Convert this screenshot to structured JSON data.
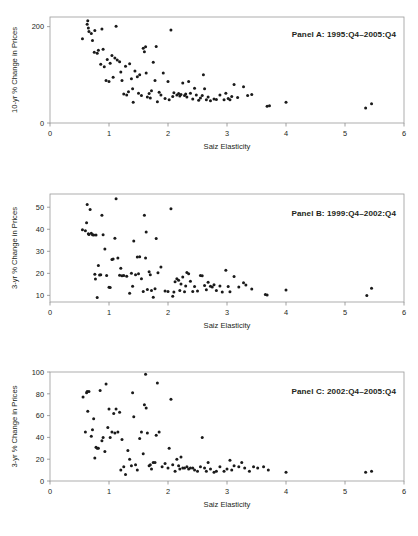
{
  "figure": {
    "background": "#ffffff",
    "point_color": "#1a1a1a",
    "axis_color": "#8c8c8c"
  },
  "chart_data": [
    {
      "type": "scatter",
      "panel_id": "A",
      "title": "Panel A:  1995:Q4–2005:Q4",
      "xlabel": "Saiz Elasticity",
      "ylabel": "10-yr % Change in Prices",
      "xlim": [
        0,
        6
      ],
      "ylim": [
        0,
        220
      ],
      "xticks": [
        0,
        1,
        2,
        3,
        4,
        5,
        6
      ],
      "yticks": [
        0,
        200
      ],
      "grid": false,
      "legend": "none",
      "points": [
        [
          0.55,
          175
        ],
        [
          0.63,
          205
        ],
        [
          0.64,
          212
        ],
        [
          0.65,
          197
        ],
        [
          0.66,
          190
        ],
        [
          0.7,
          186
        ],
        [
          0.72,
          171
        ],
        [
          0.75,
          147
        ],
        [
          0.76,
          192
        ],
        [
          0.8,
          145
        ],
        [
          0.82,
          151
        ],
        [
          0.86,
          122
        ],
        [
          0.88,
          195
        ],
        [
          0.9,
          153
        ],
        [
          0.92,
          117
        ],
        [
          0.95,
          88
        ],
        [
          0.97,
          132
        ],
        [
          1.0,
          86
        ],
        [
          1.02,
          124
        ],
        [
          1.05,
          140
        ],
        [
          1.07,
          95
        ],
        [
          1.1,
          135
        ],
        [
          1.12,
          201
        ],
        [
          1.14,
          131
        ],
        [
          1.18,
          127
        ],
        [
          1.2,
          106
        ],
        [
          1.22,
          88
        ],
        [
          1.25,
          60
        ],
        [
          1.28,
          118
        ],
        [
          1.3,
          58
        ],
        [
          1.33,
          65
        ],
        [
          1.35,
          123
        ],
        [
          1.38,
          92
        ],
        [
          1.4,
          71
        ],
        [
          1.41,
          43
        ],
        [
          1.44,
          108
        ],
        [
          1.48,
          96
        ],
        [
          1.5,
          62
        ],
        [
          1.52,
          100
        ],
        [
          1.55,
          57
        ],
        [
          1.58,
          155
        ],
        [
          1.6,
          148
        ],
        [
          1.62,
          158
        ],
        [
          1.63,
          104
        ],
        [
          1.65,
          54
        ],
        [
          1.68,
          61
        ],
        [
          1.7,
          52
        ],
        [
          1.72,
          67
        ],
        [
          1.75,
          126
        ],
        [
          1.78,
          88
        ],
        [
          1.8,
          159
        ],
        [
          1.82,
          44
        ],
        [
          1.85,
          64
        ],
        [
          1.88,
          58
        ],
        [
          1.92,
          104
        ],
        [
          1.95,
          51
        ],
        [
          2.0,
          86
        ],
        [
          2.02,
          48
        ],
        [
          2.05,
          193
        ],
        [
          2.08,
          55
        ],
        [
          2.1,
          63
        ],
        [
          2.15,
          58
        ],
        [
          2.18,
          61
        ],
        [
          2.2,
          56
        ],
        [
          2.22,
          59
        ],
        [
          2.25,
          83
        ],
        [
          2.28,
          57
        ],
        [
          2.3,
          60
        ],
        [
          2.32,
          54
        ],
        [
          2.35,
          86
        ],
        [
          2.38,
          62
        ],
        [
          2.42,
          50
        ],
        [
          2.45,
          72
        ],
        [
          2.48,
          58
        ],
        [
          2.52,
          47
        ],
        [
          2.55,
          52
        ],
        [
          2.58,
          57
        ],
        [
          2.6,
          100
        ],
        [
          2.62,
          71
        ],
        [
          2.65,
          48
        ],
        [
          2.68,
          54
        ],
        [
          2.72,
          46
        ],
        [
          2.78,
          50
        ],
        [
          2.82,
          49
        ],
        [
          2.88,
          58
        ],
        [
          2.95,
          48
        ],
        [
          2.98,
          62
        ],
        [
          3.02,
          51
        ],
        [
          3.05,
          48
        ],
        [
          3.08,
          55
        ],
        [
          3.12,
          80
        ],
        [
          3.18,
          53
        ],
        [
          3.28,
          75
        ],
        [
          3.35,
          57
        ],
        [
          3.42,
          59
        ],
        [
          3.68,
          35
        ],
        [
          3.72,
          36
        ],
        [
          4.0,
          43
        ],
        [
          5.35,
          31
        ],
        [
          5.45,
          40
        ]
      ]
    },
    {
      "type": "scatter",
      "panel_id": "B",
      "title": "Panel B:  1999:Q4–2002:Q4",
      "xlabel": "Saiz Elasticity",
      "ylabel": "3-yr % Change in Prices",
      "xlim": [
        0,
        6
      ],
      "ylim": [
        7,
        56
      ],
      "xticks": [
        0,
        1,
        2,
        3,
        4,
        5,
        6
      ],
      "yticks": [
        10,
        20,
        30,
        40,
        50
      ],
      "grid": false,
      "legend": "none",
      "points": [
        [
          0.55,
          39.8
        ],
        [
          0.6,
          39.3
        ],
        [
          0.62,
          43.0
        ],
        [
          0.63,
          51.2
        ],
        [
          0.65,
          38.0
        ],
        [
          0.66,
          37.6
        ],
        [
          0.68,
          49.0
        ],
        [
          0.7,
          38.2
        ],
        [
          0.72,
          37.5
        ],
        [
          0.74,
          37.4
        ],
        [
          0.76,
          19.6
        ],
        [
          0.77,
          17.4
        ],
        [
          0.78,
          37.4
        ],
        [
          0.8,
          9.0
        ],
        [
          0.82,
          23.6
        ],
        [
          0.84,
          19.2
        ],
        [
          0.86,
          19.4
        ],
        [
          0.88,
          46.4
        ],
        [
          0.9,
          37.5
        ],
        [
          0.93,
          31.0
        ],
        [
          0.96,
          19.0
        ],
        [
          1.0,
          13.7
        ],
        [
          1.02,
          13.6
        ],
        [
          1.05,
          26.3
        ],
        [
          1.07,
          26.5
        ],
        [
          1.1,
          35.9
        ],
        [
          1.12,
          53.8
        ],
        [
          1.15,
          27.0
        ],
        [
          1.18,
          19.1
        ],
        [
          1.2,
          22.3
        ],
        [
          1.22,
          18.9
        ],
        [
          1.25,
          19.0
        ],
        [
          1.3,
          18.7
        ],
        [
          1.35,
          11.0
        ],
        [
          1.38,
          20.0
        ],
        [
          1.4,
          14.1
        ],
        [
          1.42,
          34.7
        ],
        [
          1.45,
          19.4
        ],
        [
          1.48,
          27.4
        ],
        [
          1.5,
          19.8
        ],
        [
          1.52,
          27.5
        ],
        [
          1.55,
          17.5
        ],
        [
          1.58,
          11.8
        ],
        [
          1.6,
          46.4
        ],
        [
          1.62,
          27.0
        ],
        [
          1.63,
          38.8
        ],
        [
          1.65,
          12.7
        ],
        [
          1.68,
          20.7
        ],
        [
          1.7,
          19.4
        ],
        [
          1.72,
          12.2
        ],
        [
          1.75,
          9.2
        ],
        [
          1.78,
          13.0
        ],
        [
          1.8,
          35.8
        ],
        [
          1.83,
          20.3
        ],
        [
          1.88,
          22.9
        ],
        [
          1.95,
          12.0
        ],
        [
          2.0,
          11.8
        ],
        [
          2.05,
          49.3
        ],
        [
          2.08,
          9.6
        ],
        [
          2.1,
          11.5
        ],
        [
          2.12,
          16.2
        ],
        [
          2.15,
          17.5
        ],
        [
          2.18,
          16.9
        ],
        [
          2.2,
          12.2
        ],
        [
          2.22,
          15.2
        ],
        [
          2.25,
          18.3
        ],
        [
          2.28,
          11.7
        ],
        [
          2.3,
          14.3
        ],
        [
          2.32,
          20.4
        ],
        [
          2.35,
          19.8
        ],
        [
          2.38,
          16.4
        ],
        [
          2.42,
          11.8
        ],
        [
          2.45,
          14.0
        ],
        [
          2.5,
          12.0
        ],
        [
          2.55,
          19.0
        ],
        [
          2.58,
          18.9
        ],
        [
          2.62,
          14.5
        ],
        [
          2.65,
          12.6
        ],
        [
          2.68,
          16.0
        ],
        [
          2.72,
          14.1
        ],
        [
          2.75,
          13.8
        ],
        [
          2.78,
          14.8
        ],
        [
          2.82,
          12.2
        ],
        [
          2.88,
          14.3
        ],
        [
          2.92,
          11.5
        ],
        [
          2.98,
          21.4
        ],
        [
          3.02,
          14.0
        ],
        [
          3.05,
          11.6
        ],
        [
          3.12,
          18.6
        ],
        [
          3.2,
          13.8
        ],
        [
          3.28,
          15.7
        ],
        [
          3.32,
          14.7
        ],
        [
          3.42,
          12.9
        ],
        [
          3.65,
          10.4
        ],
        [
          3.68,
          10.2
        ],
        [
          4.0,
          12.4
        ],
        [
          5.37,
          10.0
        ],
        [
          5.45,
          13.2
        ]
      ]
    },
    {
      "type": "scatter",
      "panel_id": "C",
      "title": "Panel C:  2002:Q4–2005:Q4",
      "xlabel": "Saiz Elasticity",
      "ylabel": "3-yr % Change in Prices",
      "xlim": [
        0,
        6
      ],
      "ylim": [
        0,
        100
      ],
      "xticks": [
        0,
        1,
        2,
        3,
        4,
        5,
        6
      ],
      "yticks": [
        0,
        20,
        40,
        60,
        80,
        100
      ],
      "grid": false,
      "legend": "none",
      "points": [
        [
          0.56,
          77
        ],
        [
          0.6,
          45
        ],
        [
          0.62,
          81
        ],
        [
          0.63,
          82
        ],
        [
          0.64,
          64
        ],
        [
          0.66,
          82
        ],
        [
          0.7,
          41
        ],
        [
          0.72,
          47
        ],
        [
          0.74,
          57
        ],
        [
          0.76,
          21
        ],
        [
          0.78,
          31
        ],
        [
          0.8,
          30
        ],
        [
          0.82,
          30
        ],
        [
          0.85,
          83
        ],
        [
          0.88,
          37
        ],
        [
          0.9,
          40
        ],
        [
          0.93,
          27
        ],
        [
          0.95,
          89
        ],
        [
          0.98,
          49
        ],
        [
          1.0,
          66
        ],
        [
          1.02,
          40
        ],
        [
          1.05,
          45
        ],
        [
          1.08,
          62
        ],
        [
          1.1,
          44
        ],
        [
          1.12,
          66
        ],
        [
          1.15,
          45
        ],
        [
          1.18,
          63
        ],
        [
          1.2,
          10
        ],
        [
          1.22,
          38
        ],
        [
          1.25,
          13
        ],
        [
          1.28,
          6
        ],
        [
          1.32,
          28
        ],
        [
          1.35,
          20
        ],
        [
          1.38,
          14
        ],
        [
          1.4,
          81
        ],
        [
          1.42,
          59
        ],
        [
          1.45,
          15
        ],
        [
          1.48,
          10
        ],
        [
          1.52,
          39
        ],
        [
          1.55,
          45
        ],
        [
          1.58,
          25
        ],
        [
          1.6,
          70
        ],
        [
          1.62,
          98
        ],
        [
          1.63,
          67
        ],
        [
          1.65,
          44
        ],
        [
          1.68,
          14
        ],
        [
          1.7,
          15
        ],
        [
          1.72,
          11
        ],
        [
          1.75,
          17
        ],
        [
          1.78,
          17
        ],
        [
          1.8,
          42
        ],
        [
          1.82,
          90
        ],
        [
          1.85,
          45
        ],
        [
          1.9,
          13
        ],
        [
          1.95,
          16
        ],
        [
          2.0,
          12
        ],
        [
          2.02,
          30
        ],
        [
          2.05,
          75
        ],
        [
          2.08,
          15
        ],
        [
          2.12,
          9
        ],
        [
          2.15,
          20
        ],
        [
          2.18,
          14
        ],
        [
          2.2,
          11
        ],
        [
          2.22,
          22
        ],
        [
          2.25,
          12
        ],
        [
          2.28,
          12
        ],
        [
          2.32,
          13
        ],
        [
          2.35,
          11
        ],
        [
          2.38,
          12
        ],
        [
          2.42,
          12
        ],
        [
          2.45,
          10
        ],
        [
          2.5,
          9
        ],
        [
          2.55,
          13
        ],
        [
          2.58,
          40
        ],
        [
          2.62,
          12
        ],
        [
          2.65,
          9
        ],
        [
          2.68,
          17
        ],
        [
          2.72,
          11
        ],
        [
          2.78,
          8
        ],
        [
          2.82,
          9
        ],
        [
          2.88,
          13
        ],
        [
          2.95,
          9
        ],
        [
          3.0,
          11
        ],
        [
          3.05,
          19
        ],
        [
          3.08,
          10
        ],
        [
          3.12,
          14
        ],
        [
          3.2,
          13
        ],
        [
          3.25,
          17
        ],
        [
          3.3,
          12
        ],
        [
          3.38,
          9
        ],
        [
          3.45,
          13
        ],
        [
          3.52,
          12
        ],
        [
          3.62,
          13
        ],
        [
          3.7,
          10
        ],
        [
          4.0,
          8
        ],
        [
          5.35,
          8
        ],
        [
          5.45,
          9
        ]
      ]
    }
  ]
}
